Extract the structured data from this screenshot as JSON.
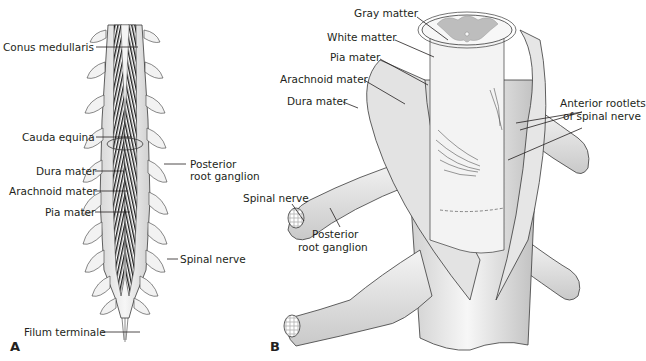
{
  "figure": {
    "panel_a": {
      "letter": "A",
      "labels": {
        "conus_medullaris": "Conus medullaris",
        "cauda_equina": "Cauda equina",
        "dura_mater": "Dura mater",
        "arachnoid_mater": "Arachnoid mater",
        "pia_mater": "Pia mater",
        "posterior_root_ganglion_line1": "Posterior",
        "posterior_root_ganglion_line2": "root ganglion",
        "spinal_nerve": "Spinal nerve",
        "filum_terminale": "Filum terminale"
      }
    },
    "panel_b": {
      "letter": "B",
      "labels": {
        "gray_matter": "Gray matter",
        "white_matter": "White matter",
        "pia_mater": "Pia mater",
        "arachnoid_mater": "Arachnoid mater",
        "dura_mater": "Dura mater",
        "anterior_rootlets_line1": "Anterior rootlets",
        "anterior_rootlets_line2": "of spinal nerve",
        "spinal_nerve": "Spinal nerve",
        "posterior_root_ganglion_line1": "Posterior",
        "posterior_root_ganglion_line2": "root ganglion"
      }
    },
    "colors": {
      "outline": "#3a3a3a",
      "tissue_light": "#efefef",
      "tissue_mid": "#d4d4d4",
      "gray_matter": "#bdbdbd",
      "nerve_fibers": "#1e1e1e"
    }
  }
}
